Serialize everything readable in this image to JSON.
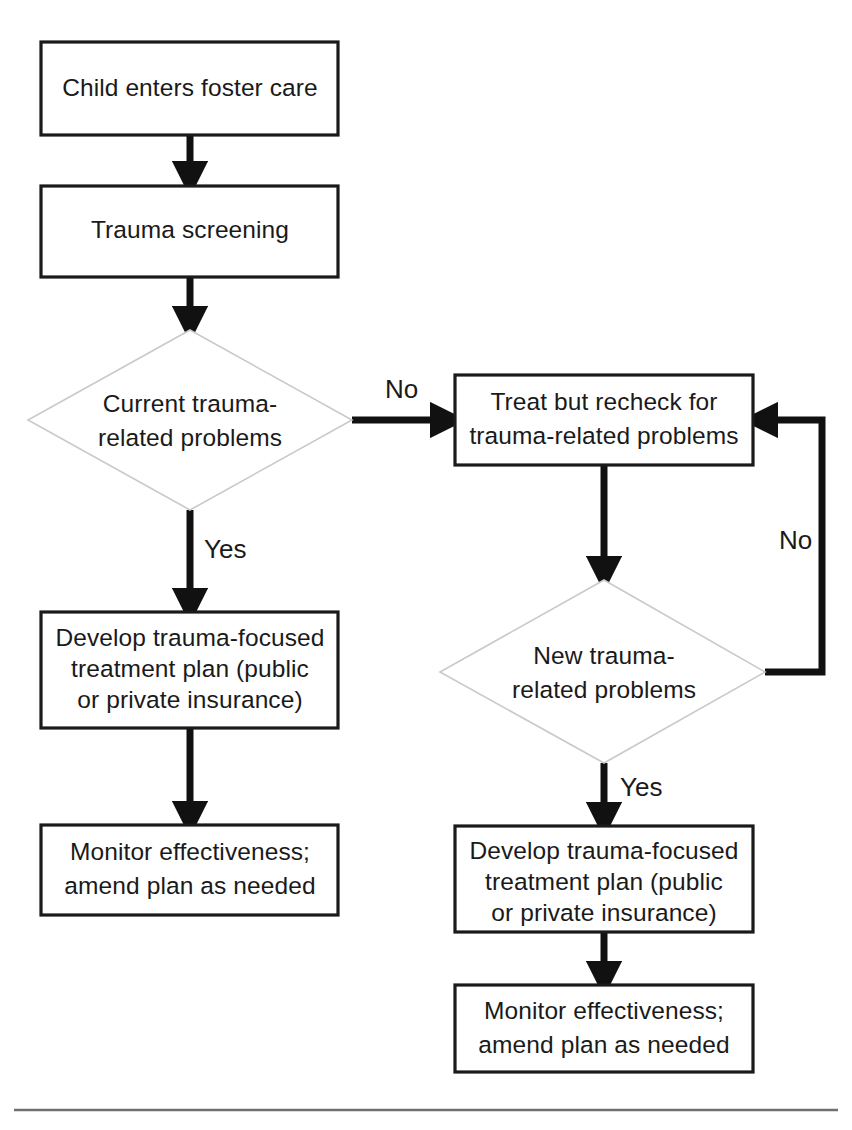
{
  "diagram": {
    "type": "flowchart",
    "canvas": {
      "width": 852,
      "height": 1130
    },
    "colors": {
      "box_stroke": "#1a1a1a",
      "diamond_stroke": "#c9c9c9",
      "connector": "#111111",
      "text": "#1a1a1a",
      "background": "#ffffff",
      "footer_rule": "#6f6f6f"
    },
    "nodes": {
      "child_enters": {
        "shape": "rectangle",
        "lines": [
          "Child enters foster care"
        ]
      },
      "trauma_screening": {
        "shape": "rectangle",
        "lines": [
          "Trauma screening"
        ]
      },
      "current_problems": {
        "shape": "diamond",
        "lines": [
          "Current trauma-",
          "related problems"
        ]
      },
      "treat_recheck": {
        "shape": "rectangle",
        "lines": [
          "Treat but recheck for",
          "trauma-related problems"
        ]
      },
      "new_problems": {
        "shape": "diamond",
        "lines": [
          "New trauma-",
          "related problems"
        ]
      },
      "develop_plan_left": {
        "shape": "rectangle",
        "lines": [
          "Develop trauma-focused",
          "treatment plan (public",
          "or private insurance)"
        ]
      },
      "monitor_left": {
        "shape": "rectangle",
        "lines": [
          "Monitor effectiveness;",
          "amend plan as needed"
        ]
      },
      "develop_plan_right": {
        "shape": "rectangle",
        "lines": [
          "Develop trauma-focused",
          "treatment plan (public",
          "or private insurance)"
        ]
      },
      "monitor_right": {
        "shape": "rectangle",
        "lines": [
          "Monitor effectiveness;",
          "amend plan as needed"
        ]
      }
    },
    "edge_labels": {
      "current_no": "No",
      "current_yes": "Yes",
      "loop_no": "No",
      "new_yes": "Yes"
    },
    "edges": [
      {
        "from": "child_enters",
        "to": "trauma_screening",
        "label": ""
      },
      {
        "from": "trauma_screening",
        "to": "current_problems",
        "label": ""
      },
      {
        "from": "current_problems",
        "to": "treat_recheck",
        "label": "No"
      },
      {
        "from": "current_problems",
        "to": "develop_plan_left",
        "label": "Yes"
      },
      {
        "from": "develop_plan_left",
        "to": "monitor_left",
        "label": ""
      },
      {
        "from": "treat_recheck",
        "to": "new_problems",
        "label": ""
      },
      {
        "from": "new_problems",
        "to": "treat_recheck",
        "label": "No"
      },
      {
        "from": "new_problems",
        "to": "develop_plan_right",
        "label": "Yes"
      },
      {
        "from": "develop_plan_right",
        "to": "monitor_right",
        "label": ""
      }
    ]
  }
}
